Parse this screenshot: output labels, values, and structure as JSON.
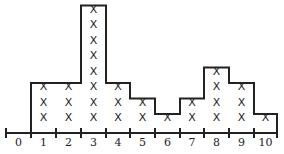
{
  "chart_data": {
    "type": "bar",
    "subtype": "dot-plot-histogram",
    "title": "",
    "xlabel": "",
    "ylabel": "",
    "categories": [
      "0",
      "1",
      "2",
      "3",
      "4",
      "5",
      "6",
      "7",
      "8",
      "9",
      "10"
    ],
    "values": [
      0,
      3,
      3,
      8,
      3,
      2,
      1,
      2,
      4,
      3,
      1
    ],
    "marker": "X",
    "grid": false,
    "legend": null,
    "xlim": [
      0,
      10
    ]
  },
  "labels": [
    "0",
    "1",
    "2",
    "3",
    "4",
    "5",
    "6",
    "7",
    "8",
    "9",
    "10"
  ]
}
